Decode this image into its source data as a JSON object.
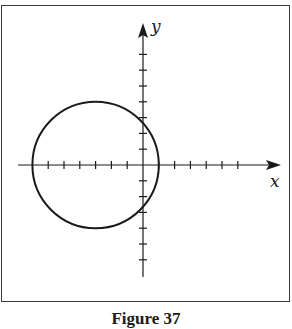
{
  "figure": {
    "caption": "Figure 37",
    "x_axis_label": "x",
    "y_axis_label": "y",
    "ink_color": "#1a1a1a",
    "frame_color": "#3a3a3a"
  },
  "geometry": {
    "origin_px": [
      143,
      165
    ],
    "unit_px": 15.8,
    "x_ticks_negative": 6,
    "x_ticks_positive": 6,
    "y_ticks_positive": 7,
    "y_ticks_negative": 6,
    "circle": {
      "center": [
        -3,
        0
      ],
      "radius": 4
    }
  }
}
